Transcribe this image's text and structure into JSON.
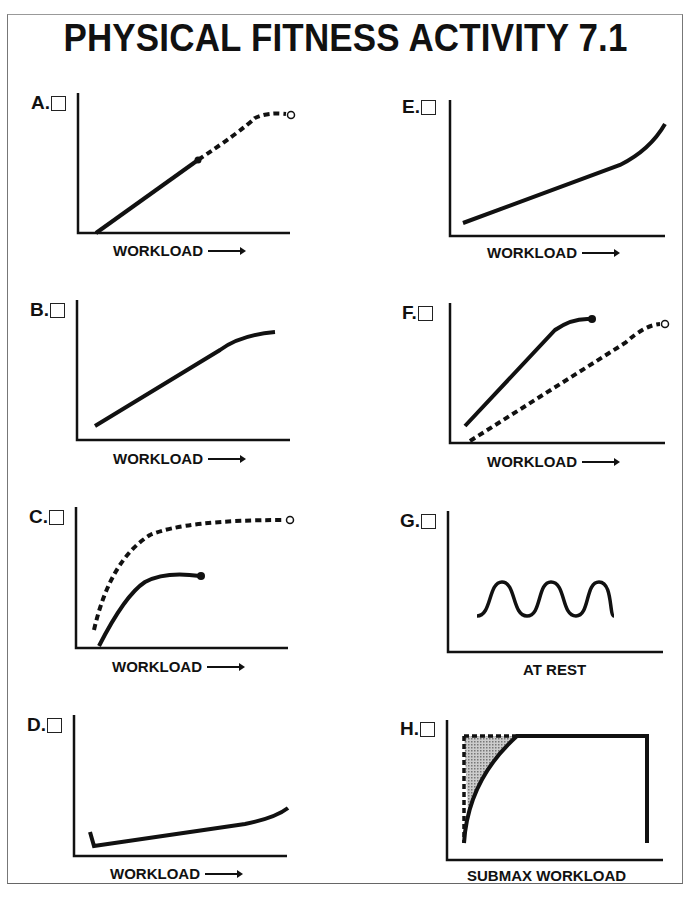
{
  "title": "PHYSICAL FITNESS ACTIVITY 7.1",
  "panels": {
    "A": {
      "label": "A.",
      "xlabel": "WORKLOAD"
    },
    "B": {
      "label": "B.",
      "xlabel": "WORKLOAD"
    },
    "C": {
      "label": "C.",
      "xlabel": "WORKLOAD"
    },
    "D": {
      "label": "D.",
      "xlabel": "WORKLOAD"
    },
    "E": {
      "label": "E.",
      "xlabel": "WORKLOAD"
    },
    "F": {
      "label": "F.",
      "xlabel": "WORKLOAD"
    },
    "G": {
      "label": "G.",
      "xlabel": "AT REST"
    },
    "H": {
      "label": "H.",
      "xlabel": "SUBMAX WORKLOAD"
    }
  },
  "colors": {
    "ink": "#111111",
    "shade": "#aaaaaa"
  }
}
